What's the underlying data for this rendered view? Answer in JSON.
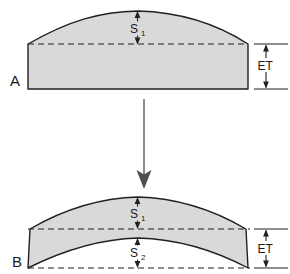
{
  "figure": {
    "background_color": "#ffffff",
    "line_color": "#231f20",
    "fill_color": "#d9d9d9",
    "process_arrow_color": "#4d4d4d"
  },
  "panels": [
    {
      "id": "A",
      "label": "A",
      "description": "Plano-convex lens blank with flat base, convex top surface",
      "dimensions": [
        {
          "name": "sag-top",
          "label": "S",
          "subscript": "1"
        },
        {
          "name": "edge-thickness",
          "label": "ET",
          "subscript": ""
        }
      ]
    },
    {
      "id": "B",
      "label": "B",
      "description": "Meniscus lens with convex top surface and concave bottom surface",
      "dimensions": [
        {
          "name": "sag-top",
          "label": "S",
          "subscript": "1"
        },
        {
          "name": "sag-bottom",
          "label": "S",
          "subscript": "2"
        },
        {
          "name": "edge-thickness",
          "label": "ET",
          "subscript": ""
        }
      ]
    }
  ],
  "process_arrow": {
    "name": "process-flow-arrow",
    "direction": "down",
    "from_panel": "A",
    "to_panel": "B"
  }
}
